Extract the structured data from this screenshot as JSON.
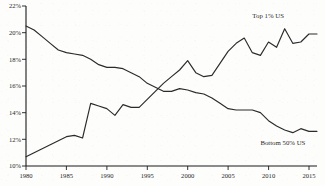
{
  "chart_data": {
    "type": "line",
    "title": "",
    "subtitle": "",
    "xlabel": "",
    "ylabel": "",
    "xlim": [
      1980,
      2016
    ],
    "ylim": [
      10,
      22
    ],
    "grid": false,
    "legend_position": "inline-annotation",
    "x_ticks": [
      "1980",
      "1985",
      "1990",
      "1995",
      "2000",
      "2005",
      "2010",
      "2015"
    ],
    "x_tick_values": [
      1980,
      1985,
      1990,
      1995,
      2000,
      2005,
      2010,
      2015
    ],
    "y_ticks": [
      "10%",
      "12%",
      "14%",
      "16%",
      "18%",
      "20%",
      "22%"
    ],
    "y_tick_values": [
      10,
      12,
      14,
      16,
      18,
      20,
      22
    ],
    "x": [
      1980,
      1981,
      1982,
      1983,
      1984,
      1985,
      1986,
      1987,
      1988,
      1989,
      1990,
      1991,
      1992,
      1993,
      1994,
      1995,
      1996,
      1997,
      1998,
      1999,
      2000,
      2001,
      2002,
      2003,
      2004,
      2005,
      2006,
      2007,
      2008,
      2009,
      2010,
      2011,
      2012,
      2013,
      2014,
      2015,
      2016
    ],
    "series": [
      {
        "name": "Top 1% US",
        "label": "Top 1% US",
        "color": "#2b2b2b",
        "values": [
          10.7,
          11.0,
          11.3,
          11.6,
          11.9,
          12.2,
          12.3,
          12.1,
          14.7,
          14.5,
          14.3,
          13.8,
          14.6,
          14.4,
          14.4,
          15.0,
          15.6,
          16.2,
          16.7,
          17.2,
          17.9,
          17.0,
          16.7,
          16.8,
          17.7,
          18.6,
          19.2,
          19.6,
          18.5,
          18.3,
          19.3,
          18.9,
          20.3,
          19.2,
          19.3,
          19.9,
          19.9
        ]
      },
      {
        "name": "Bottom 50% US",
        "label": "Bottom 50% US",
        "color": "#2b2b2b",
        "values": [
          20.5,
          20.2,
          19.7,
          19.2,
          18.7,
          18.5,
          18.4,
          18.3,
          18.0,
          17.6,
          17.4,
          17.4,
          17.3,
          17.0,
          16.7,
          16.2,
          15.9,
          15.6,
          15.6,
          15.8,
          15.7,
          15.5,
          15.4,
          15.1,
          14.7,
          14.3,
          14.2,
          14.2,
          14.2,
          14.0,
          13.4,
          13.0,
          12.7,
          12.5,
          12.8,
          12.6,
          12.6
        ]
      }
    ],
    "annotations": [
      {
        "text": "Top 1% US",
        "x": 2008,
        "y": 21.1
      },
      {
        "text": "Bottom 50% US",
        "x": 2009,
        "y": 11.6
      }
    ]
  }
}
